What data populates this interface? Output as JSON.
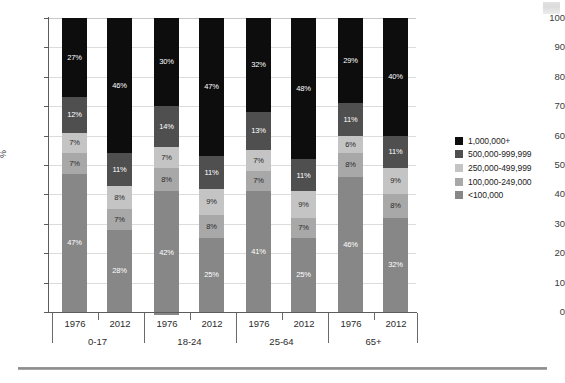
{
  "chart_data": {
    "type": "bar",
    "subtype": "stacked-percent",
    "title": "",
    "xlabel": "",
    "ylabel": "%",
    "ylim": [
      0,
      100
    ],
    "ytick_step": 10,
    "yticks": [
      100,
      90,
      80,
      70,
      60,
      50,
      40,
      30,
      20,
      10,
      0
    ],
    "grid": true,
    "legend_position": "right",
    "categories": [
      "1976",
      "2012",
      "1976",
      "2012",
      "1976",
      "2012",
      "1976",
      "2012"
    ],
    "groups": [
      {
        "label": "0-17",
        "years": [
          "1976",
          "2012"
        ]
      },
      {
        "label": "18-24",
        "years": [
          "1976",
          "2012"
        ]
      },
      {
        "label": "25-64",
        "years": [
          "1976",
          "2012"
        ]
      },
      {
        "label": "65+",
        "years": [
          "1976",
          "2012"
        ]
      }
    ],
    "series": [
      {
        "name": "1,000,000+",
        "color": "#0d0d0d",
        "label_color": "#ffffff",
        "values": [
          27,
          46,
          30,
          47,
          32,
          48,
          29,
          40
        ]
      },
      {
        "name": "500,000-999,999",
        "color": "#4f4f4f",
        "label_color": "#ffffff",
        "values": [
          12,
          11,
          14,
          11,
          13,
          11,
          11,
          11
        ]
      },
      {
        "name": "250,000-499,999",
        "color": "#c4c4c4",
        "label_color": "#2b2b2b",
        "values": [
          7,
          8,
          7,
          9,
          7,
          9,
          6,
          9
        ]
      },
      {
        "name": "100,000-249,000",
        "color": "#a8a8a8",
        "label_color": "#2b2b2b",
        "values": [
          7,
          7,
          8,
          8,
          7,
          7,
          8,
          8
        ]
      },
      {
        "name": "<100,000",
        "color": "#878787",
        "label_color": "#ffffff",
        "values": [
          47,
          28,
          42,
          25,
          41,
          25,
          46,
          32
        ]
      }
    ],
    "bar_labels": [
      [
        "27%",
        "12%",
        "7%",
        "7%",
        "47%"
      ],
      [
        "46%",
        "11%",
        "8%",
        "7%",
        "28%"
      ],
      [
        "30%",
        "14%",
        "7%",
        "8%",
        "42%"
      ],
      [
        "47%",
        "11%",
        "9%",
        "8%",
        "25%"
      ],
      [
        "32%",
        "13%",
        "7%",
        "7%",
        "41%"
      ],
      [
        "48%",
        "11%",
        "9%",
        "7%",
        "25%"
      ],
      [
        "29%",
        "11%",
        "6%",
        "8%",
        "46%"
      ],
      [
        "40%",
        "11%",
        "9%",
        "8%",
        "32%"
      ]
    ]
  },
  "legend": {
    "items": [
      {
        "label": "1,000,000+",
        "color": "#0d0d0d"
      },
      {
        "label": "500,000-999,999",
        "color": "#4f4f4f"
      },
      {
        "label": "250,000-499,999",
        "color": "#c4c4c4"
      },
      {
        "label": "100,000-249,000",
        "color": "#a8a8a8"
      },
      {
        "label": "<100,000",
        "color": "#878787"
      }
    ]
  }
}
